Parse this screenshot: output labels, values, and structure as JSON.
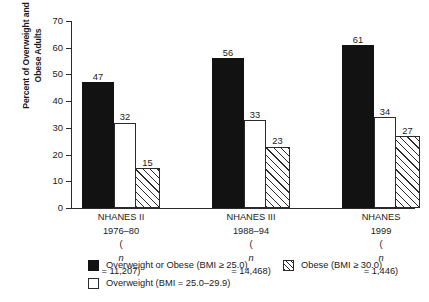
{
  "chart_data": {
    "type": "bar",
    "title": "",
    "subtitle": "",
    "xlabel": "",
    "ylabel": "Percent of Overweight and Obese Adults",
    "ylabel_lines": [
      "Percent of Overweight and",
      "Obese Adults"
    ],
    "ylim": [
      0,
      70
    ],
    "ytick_step": 10,
    "yticks": [
      0,
      10,
      20,
      30,
      40,
      50,
      60,
      70
    ],
    "ytick_labels": [
      "0",
      "10",
      "20",
      "30",
      "40",
      "50",
      "60",
      "70"
    ],
    "grid": false,
    "legend_position": "bottom",
    "categories": [
      "NHANES II",
      "NHANES III",
      "NHANES"
    ],
    "category_labels": [
      [
        "NHANES II",
        "1976–80",
        "(n = 11,207)"
      ],
      [
        "NHANES III",
        "1988–94",
        "(n = 14,468)"
      ],
      [
        "NHANES",
        "1999",
        "(n = 1,446)"
      ]
    ],
    "series": [
      {
        "name": "Overweight or Obese (BMI ≥ 25.0)",
        "fill": "solid-black",
        "color": "#121212",
        "values": [
          47,
          56,
          61
        ]
      },
      {
        "name": "Overweight (BMI = 25.0–29.9)",
        "fill": "open-white",
        "color": "#ffffff",
        "values": [
          32,
          33,
          34
        ]
      },
      {
        "name": "Obese (BMI ≥ 30.0)",
        "fill": "diagonal-hatch",
        "color": "#ffffff",
        "values": [
          15,
          23,
          27
        ]
      }
    ],
    "legend": [
      "Overweight or Obese (BMI ≥ 25.0)",
      "Overweight (BMI = 25.0–29.9)",
      "Obese (BMI ≥ 30.0)"
    ],
    "data_labels": [
      [
        "47",
        "32",
        "15"
      ],
      [
        "56",
        "33",
        "23"
      ],
      [
        "61",
        "34",
        "27"
      ]
    ]
  },
  "axis": {
    "yticks": [
      {
        "label": "70",
        "value": 70
      },
      {
        "label": "60",
        "value": 60
      },
      {
        "label": "50",
        "value": 50
      },
      {
        "label": "40",
        "value": 40
      },
      {
        "label": "30",
        "value": 30
      },
      {
        "label": "20",
        "value": 20
      },
      {
        "label": "10",
        "value": 10
      },
      {
        "label": "0",
        "value": 0
      }
    ]
  },
  "groups": [
    {
      "line1": "NHANES II",
      "line2": "1976–80",
      "n_open": "(",
      "n_italic": "n",
      "n_rest": " = 11,207)",
      "bars": [
        {
          "label": "47",
          "value": 47,
          "style": "solid"
        },
        {
          "label": "32",
          "value": 32,
          "style": "open"
        },
        {
          "label": "15",
          "value": 15,
          "style": "hatch"
        }
      ]
    },
    {
      "line1": "NHANES III",
      "line2": "1988–94",
      "n_open": "(",
      "n_italic": "n",
      "n_rest": " = 14,468)",
      "bars": [
        {
          "label": "56",
          "value": 56,
          "style": "solid"
        },
        {
          "label": "33",
          "value": 33,
          "style": "open"
        },
        {
          "label": "23",
          "value": 23,
          "style": "hatch"
        }
      ]
    },
    {
      "line1": "NHANES",
      "line2": "1999",
      "n_open": "(",
      "n_italic": "n",
      "n_rest": " = 1,446)",
      "bars": [
        {
          "label": "61",
          "value": 61,
          "style": "solid"
        },
        {
          "label": "34",
          "value": 34,
          "style": "open"
        },
        {
          "label": "27",
          "value": 27,
          "style": "hatch"
        }
      ]
    }
  ],
  "legend": {
    "items": [
      {
        "label": "Overweight or Obese (BMI ≥ 25.0)",
        "swatch": "solid"
      },
      {
        "label": "Overweight (BMI = 25.0–29.9)",
        "swatch": "open"
      },
      {
        "label": "Obese (BMI ≥ 30.0)",
        "swatch": "hatch"
      }
    ]
  },
  "colors": {
    "axis": "#2b2b2b",
    "bar_solid": "#121212",
    "bar_open": "#ffffff",
    "text": "#1a1a1a",
    "background": "#ffffff"
  }
}
